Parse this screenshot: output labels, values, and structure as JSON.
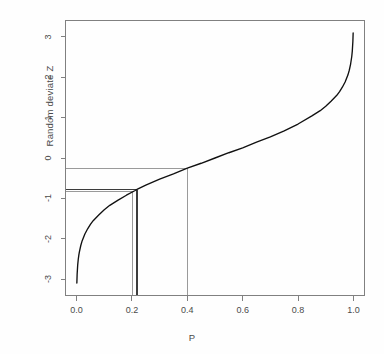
{
  "figure": {
    "background": "#ffffff",
    "frame_color": "#808080",
    "curve_color": "#111111",
    "refline_light_color": "#9a9a9a",
    "refline_dark_color": "#3c3c3c"
  },
  "chart_data": {
    "type": "line",
    "title": "",
    "subtitle": "",
    "xlabel": "P",
    "ylabel": "Random deviate Z",
    "xlim": [
      -0.04,
      1.04
    ],
    "ylim": [
      -3.4,
      3.4
    ],
    "grid": false,
    "legend": null,
    "xticks": [
      0.0,
      0.2,
      0.4,
      0.6,
      0.8,
      1.0
    ],
    "xticklabels": [
      "0.0",
      "0.2",
      "0.4",
      "0.6",
      "0.8",
      "1.0"
    ],
    "yticks": [
      -3,
      -2,
      -1,
      0,
      1,
      2,
      3
    ],
    "yticklabels": [
      "-3",
      "-2",
      "-1",
      "0",
      "1",
      "2",
      "3"
    ],
    "series": [
      {
        "name": "qnorm(P)",
        "description": "Standard normal quantile (probit) function",
        "x": [
          0.001,
          0.002,
          0.004,
          0.006,
          0.008,
          0.01,
          0.015,
          0.02,
          0.03,
          0.04,
          0.05,
          0.06,
          0.08,
          0.1,
          0.12,
          0.15,
          0.18,
          0.21,
          0.22,
          0.25,
          0.3,
          0.35,
          0.4,
          0.45,
          0.5,
          0.55,
          0.6,
          0.65,
          0.7,
          0.75,
          0.8,
          0.85,
          0.88,
          0.9,
          0.92,
          0.94,
          0.95,
          0.96,
          0.97,
          0.98,
          0.985,
          0.99,
          0.994,
          0.996,
          0.998,
          0.999
        ],
        "y": [
          -3.09,
          -2.88,
          -2.65,
          -2.51,
          -2.41,
          -2.33,
          -2.17,
          -2.05,
          -1.88,
          -1.75,
          -1.64,
          -1.55,
          -1.41,
          -1.28,
          -1.17,
          -1.04,
          -0.92,
          -0.81,
          -0.77,
          -0.67,
          -0.52,
          -0.39,
          -0.25,
          -0.13,
          0.0,
          0.13,
          0.25,
          0.39,
          0.52,
          0.67,
          0.84,
          1.04,
          1.17,
          1.28,
          1.41,
          1.55,
          1.64,
          1.75,
          1.88,
          2.05,
          2.17,
          2.33,
          2.51,
          2.65,
          2.88,
          3.09
        ]
      }
    ],
    "annotations": [
      {
        "name": "reference-line-p040",
        "kind": "horizontal+vertical",
        "label": "P = 0.40 maps to Z = -0.25",
        "p": 0.4,
        "z": -0.25,
        "style": "light-gray"
      },
      {
        "name": "reference-line-z078-a",
        "kind": "horizontal+vertical",
        "label": "Z = -0.78 maps to P = 0.218",
        "p": 0.218,
        "z": -0.78,
        "style": "dark"
      },
      {
        "name": "reference-line-z082",
        "kind": "horizontal+vertical",
        "label": "Z = -0.83 maps to P = 0.203",
        "p": 0.203,
        "z": -0.83,
        "style": "light-gray"
      }
    ]
  },
  "axes": {
    "x_axis_title": "P",
    "y_axis_title": "Random deviate Z"
  }
}
